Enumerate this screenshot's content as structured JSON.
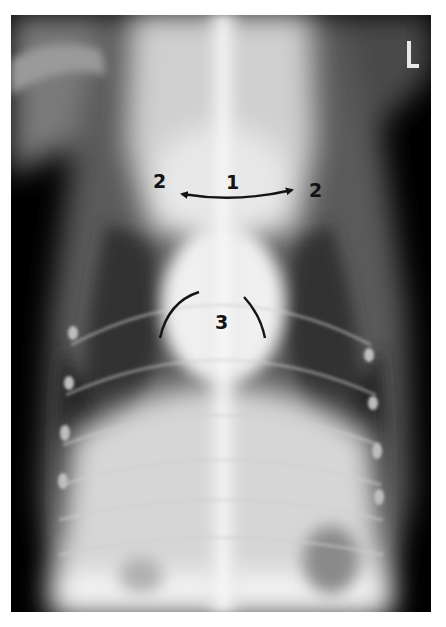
{
  "image": {
    "type": "radiograph",
    "view": "ventrodorsal thorax",
    "background_color": "#ffffff",
    "film_color": "#000000"
  },
  "marker": {
    "text": "L",
    "color": "#e8e8e8"
  },
  "annotations": {
    "label_1": "1",
    "label_2_left": "2",
    "label_2_right": "2",
    "label_3": "3",
    "ink_color": "#141414"
  }
}
